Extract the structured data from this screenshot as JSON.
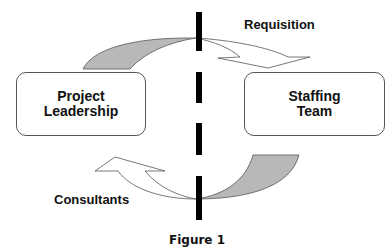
{
  "diagram": {
    "nodes": [
      {
        "id": "project-leadership",
        "label": "Project\nLeadership"
      },
      {
        "id": "staffing-team",
        "label": "Staffing\nTeam"
      }
    ],
    "edges": [
      {
        "from": "project-leadership",
        "to": "staffing-team",
        "label": "Requisition"
      },
      {
        "from": "staffing-team",
        "to": "project-leadership",
        "label": "Consultants"
      }
    ],
    "divider": "dashed-vertical-line",
    "caption": "Figure 1"
  },
  "colors": {
    "arrow_fill": "#b8b8b8",
    "outline": "#555555",
    "divider": "#000000"
  }
}
